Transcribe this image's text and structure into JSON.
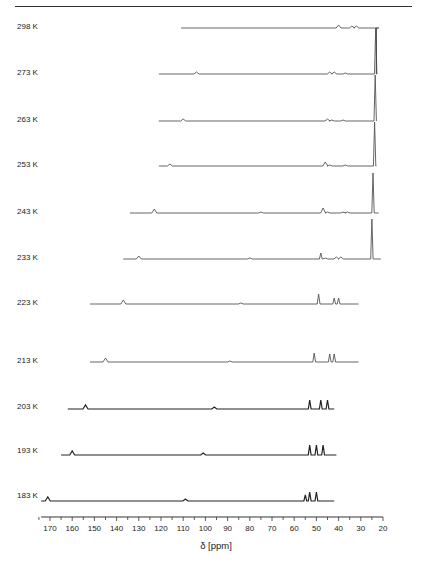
{
  "chart_data": {
    "type": "line",
    "title": "",
    "xlabel": "δ [ppm]",
    "ylabel": "",
    "x_reversed": true,
    "xlim": [
      174,
      20
    ],
    "x_ticks": [
      170,
      160,
      150,
      140,
      130,
      120,
      110,
      100,
      90,
      80,
      70,
      60,
      50,
      40,
      30,
      20
    ],
    "grid": false,
    "legend": "none",
    "layout": "stacked variable-temperature NMR spectra, one trace per temperature, labels at left",
    "series": [
      {
        "name": "298 K",
        "label_y": 28,
        "baseline_y": 28,
        "x_start": 111,
        "x_end": 23,
        "peaks": [
          {
            "ppm": 40,
            "h": 3
          },
          {
            "ppm": 34,
            "h": 2
          },
          {
            "ppm": 32,
            "h": 2
          },
          {
            "ppm": 23,
            "h": 0
          }
        ]
      },
      {
        "name": "273 K",
        "label_y": 74,
        "baseline_y": 74,
        "x_start": 121,
        "x_end": 23,
        "peaks": [
          {
            "ppm": 104,
            "h": 2
          },
          {
            "ppm": 44,
            "h": 2
          },
          {
            "ppm": 42,
            "h": 2
          },
          {
            "ppm": 37,
            "h": 1
          },
          {
            "ppm": 23.3,
            "h": 46
          }
        ]
      },
      {
        "name": "263 K",
        "label_y": 121,
        "baseline_y": 121,
        "x_start": 121,
        "x_end": 23,
        "peaks": [
          {
            "ppm": 110,
            "h": 2
          },
          {
            "ppm": 45,
            "h": 2
          },
          {
            "ppm": 43,
            "h": 1
          },
          {
            "ppm": 38,
            "h": 1
          },
          {
            "ppm": 23.5,
            "h": 46
          }
        ]
      },
      {
        "name": "253 K",
        "label_y": 166,
        "baseline_y": 166,
        "x_start": 121,
        "x_end": 23,
        "peaks": [
          {
            "ppm": 116,
            "h": 2
          },
          {
            "ppm": 46,
            "h": 4
          },
          {
            "ppm": 44,
            "h": 1
          },
          {
            "ppm": 37,
            "h": 1
          },
          {
            "ppm": 23.8,
            "h": 44
          }
        ]
      },
      {
        "name": "243 K",
        "label_y": 213,
        "baseline_y": 213,
        "x_start": 134,
        "x_end": 22,
        "peaks": [
          {
            "ppm": 123,
            "h": 4
          },
          {
            "ppm": 75,
            "h": 1
          },
          {
            "ppm": 47,
            "h": 5
          },
          {
            "ppm": 45,
            "h": 1
          },
          {
            "ppm": 38,
            "h": 1
          },
          {
            "ppm": 36,
            "h": 1
          },
          {
            "ppm": 24.5,
            "h": 40
          }
        ]
      },
      {
        "name": "233 K",
        "label_y": 259,
        "baseline_y": 259,
        "x_start": 137,
        "x_end": 21,
        "peaks": [
          {
            "ppm": 130,
            "h": 3
          },
          {
            "ppm": 80,
            "h": 1
          },
          {
            "ppm": 48,
            "h": 6
          },
          {
            "ppm": 46,
            "h": 1
          },
          {
            "ppm": 41,
            "h": 2
          },
          {
            "ppm": 39,
            "h": 2
          },
          {
            "ppm": 25,
            "h": 40
          }
        ]
      },
      {
        "name": "223 K",
        "label_y": 304,
        "baseline_y": 304,
        "x_start": 152,
        "x_end": 31,
        "peaks": [
          {
            "ppm": 137,
            "h": 4
          },
          {
            "ppm": 84,
            "h": 1
          },
          {
            "ppm": 49,
            "h": 10
          },
          {
            "ppm": 42,
            "h": 6
          },
          {
            "ppm": 40,
            "h": 6
          }
        ]
      },
      {
        "name": "213 K",
        "label_y": 362,
        "baseline_y": 362,
        "x_start": 152,
        "x_end": 31,
        "peaks": [
          {
            "ppm": 145,
            "h": 4
          },
          {
            "ppm": 89,
            "h": 1
          },
          {
            "ppm": 51,
            "h": 9
          },
          {
            "ppm": 44,
            "h": 8
          },
          {
            "ppm": 42,
            "h": 8
          }
        ]
      },
      {
        "name": "203 K",
        "label_y": 408,
        "baseline_y": 409,
        "x_start": 162,
        "x_end": 42,
        "peaks": [
          {
            "ppm": 154,
            "h": 4
          },
          {
            "ppm": 96,
            "h": 2
          },
          {
            "ppm": 53,
            "h": 9
          },
          {
            "ppm": 48,
            "h": 9
          },
          {
            "ppm": 45,
            "h": 9
          }
        ]
      },
      {
        "name": "193 K",
        "label_y": 452,
        "baseline_y": 455,
        "x_start": 165,
        "x_end": 41,
        "peaks": [
          {
            "ppm": 160,
            "h": 4
          },
          {
            "ppm": 101,
            "h": 2
          },
          {
            "ppm": 53,
            "h": 10
          },
          {
            "ppm": 50,
            "h": 10
          },
          {
            "ppm": 47,
            "h": 10
          }
        ]
      },
      {
        "name": "183 K",
        "label_y": 497,
        "baseline_y": 501,
        "x_start": 174,
        "x_end": 42,
        "peaks": [
          {
            "ppm": 171,
            "h": 4
          },
          {
            "ppm": 109,
            "h": 2
          },
          {
            "ppm": 55,
            "h": 6
          },
          {
            "ppm": 53,
            "h": 9
          },
          {
            "ppm": 50,
            "h": 9
          }
        ]
      }
    ]
  },
  "axis": {
    "xlabel": "δ [ppm]",
    "ticks": [
      "170",
      "160",
      "150",
      "140",
      "130",
      "120",
      "110",
      "100",
      "90",
      "80",
      "70",
      "60",
      "50",
      "40",
      "30",
      "20"
    ]
  }
}
